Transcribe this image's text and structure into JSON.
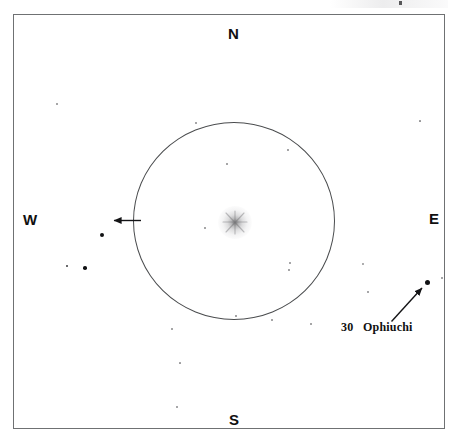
{
  "figure": {
    "kind": "star-chart",
    "background_color": "#ffffff",
    "frame_color": "#6f7173",
    "ink_color": "#111214",
    "circle_color": "#4a4c4e"
  },
  "cardinals": {
    "north": "N",
    "south": "S",
    "west": "W",
    "east": "E"
  },
  "labels": {
    "ophiuchi": "30   Ophiuchi"
  },
  "chart_data": {
    "type": "scatter",
    "title": "",
    "xlabel": "",
    "ylabel": "",
    "grid": false,
    "legend_position": "none",
    "orientation": {
      "top": "N",
      "bottom": "S",
      "left": "W",
      "right": "E"
    },
    "field_circle": {
      "center_x": 234,
      "center_y": 221,
      "radius_x": 101,
      "radius_y": 99,
      "stroke": "#4a4c4e"
    },
    "diffuse_object": {
      "name": "comet",
      "x": 235,
      "y": 222,
      "radius": 17,
      "appearance": "fuzzy gray glow with faint spikes"
    },
    "annotations": [
      {
        "name": "field-direction-arrow",
        "text": "",
        "from_x": 141,
        "from_y": 220,
        "to_x": 112,
        "to_y": 220,
        "direction": "west"
      },
      {
        "name": "ophiuchi-pointer-arrow",
        "text": "30   Ophiuchi",
        "from_x": 392,
        "from_y": 321,
        "to_x": 423,
        "to_y": 287,
        "direction": "northeast"
      }
    ],
    "stars": [
      {
        "x": 427,
        "y": 282,
        "size": 5.0,
        "name": "30 Ophiuchi"
      },
      {
        "x": 102,
        "y": 235,
        "size": 4.2,
        "name": ""
      },
      {
        "x": 85,
        "y": 268,
        "size": 3.6,
        "name": ""
      },
      {
        "x": 67,
        "y": 266,
        "size": 2.4,
        "name": ""
      },
      {
        "x": 363,
        "y": 264,
        "size": 1.8,
        "name": ""
      },
      {
        "x": 368,
        "y": 292,
        "size": 1.6,
        "name": ""
      },
      {
        "x": 290,
        "y": 263,
        "size": 1.6,
        "name": ""
      },
      {
        "x": 196,
        "y": 123,
        "size": 1.6,
        "name": ""
      },
      {
        "x": 227,
        "y": 164,
        "size": 1.5,
        "name": ""
      },
      {
        "x": 205,
        "y": 228,
        "size": 1.4,
        "name": ""
      },
      {
        "x": 288,
        "y": 150,
        "size": 1.3,
        "name": ""
      },
      {
        "x": 289,
        "y": 270,
        "size": 1.3,
        "name": ""
      },
      {
        "x": 272,
        "y": 320,
        "size": 1.4,
        "name": ""
      },
      {
        "x": 236,
        "y": 316,
        "size": 1.3,
        "name": ""
      },
      {
        "x": 172,
        "y": 329,
        "size": 1.5,
        "name": ""
      },
      {
        "x": 180,
        "y": 363,
        "size": 1.7,
        "name": ""
      },
      {
        "x": 177,
        "y": 407,
        "size": 1.6,
        "name": ""
      },
      {
        "x": 311,
        "y": 324,
        "size": 1.4,
        "name": ""
      },
      {
        "x": 57,
        "y": 104,
        "size": 1.5,
        "name": ""
      },
      {
        "x": 442,
        "y": 278,
        "size": 1.3,
        "name": ""
      },
      {
        "x": 420,
        "y": 121,
        "size": 1.2,
        "name": ""
      }
    ],
    "axis_ranges": {
      "x": [
        13,
        445
      ],
      "y": [
        14,
        429
      ]
    }
  }
}
